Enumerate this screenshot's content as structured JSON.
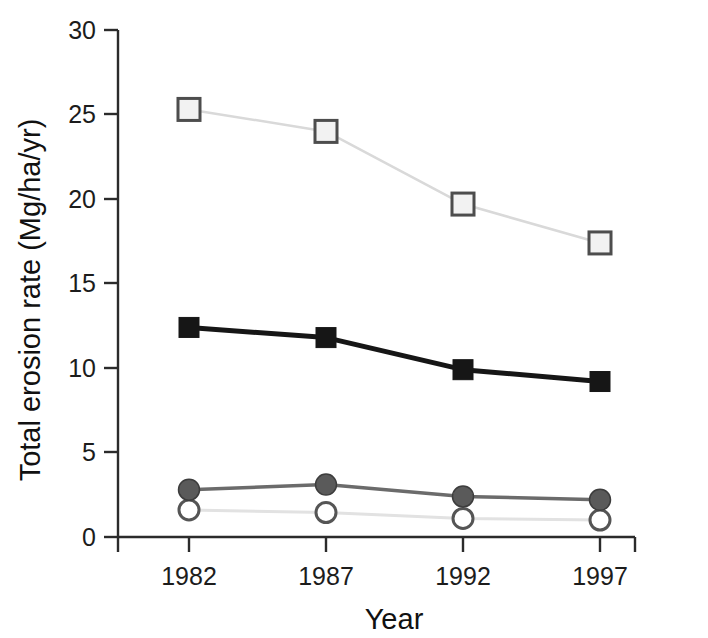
{
  "chart_data": {
    "type": "line",
    "title": "",
    "xlabel": "Year",
    "ylabel": "Total erosion rate (Mg/ha/yr)",
    "categories": [
      "1982",
      "1987",
      "1992",
      "1997"
    ],
    "x": [
      1982,
      1987,
      1992,
      1997
    ],
    "xlim": [
      1980,
      1999
    ],
    "ylim": [
      0,
      30
    ],
    "y_ticks": [
      0,
      5,
      10,
      15,
      20,
      25,
      30
    ],
    "y_tick_labels": [
      "0",
      "5",
      "10",
      "15",
      "20",
      "25",
      "30"
    ],
    "x_ticks": [
      1982,
      1987,
      1992,
      1997
    ],
    "x_tick_labels": [
      "1982",
      "1987",
      "1992",
      "1997"
    ],
    "grid": false,
    "legend": "none",
    "series": [
      {
        "name": "open-square-series",
        "marker": "open-square",
        "marker_fill": "#f2f2f2",
        "marker_edge": "#4d4d4d",
        "line_color": "#d9d9d9",
        "line_width": 2.5,
        "values": [
          25.3,
          24.0,
          19.7,
          17.4
        ]
      },
      {
        "name": "filled-square-series",
        "marker": "filled-square",
        "marker_fill": "#161616",
        "marker_edge": "#161616",
        "line_color": "#161616",
        "line_width": 5,
        "values": [
          12.4,
          11.8,
          9.9,
          9.2
        ]
      },
      {
        "name": "filled-circle-series",
        "marker": "filled-circle",
        "marker_fill": "#5a5a5a",
        "marker_edge": "#3d3d3d",
        "line_color": "#6b6b6b",
        "line_width": 3.5,
        "values": [
          2.8,
          3.1,
          2.4,
          2.2
        ]
      },
      {
        "name": "open-circle-series",
        "marker": "open-circle",
        "marker_fill": "#ffffff",
        "marker_edge": "#555555",
        "line_color": "#e2e2e2",
        "line_width": 3,
        "values": [
          1.6,
          1.45,
          1.1,
          1.0
        ]
      }
    ],
    "axis_color": "#2b2b2b",
    "background": "#ffffff"
  },
  "axes": {
    "y_title": "Total erosion rate (Mg/ha/yr)",
    "x_title": "Year",
    "y_labels": {
      "t0": "0",
      "t5": "5",
      "t10": "10",
      "t15": "15",
      "t20": "20",
      "t25": "25",
      "t30": "30"
    },
    "x_labels": {
      "c0": "1982",
      "c1": "1987",
      "c2": "1992",
      "c3": "1997"
    }
  }
}
